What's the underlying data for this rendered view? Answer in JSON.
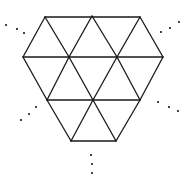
{
  "diagram": {
    "colors": {
      "stroke": "#1a1a1a",
      "dots": "#444444",
      "background": "#ffffff"
    },
    "vertices": {
      "t1": [
        45,
        17
      ],
      "t2": [
        92,
        16
      ],
      "t3": [
        140,
        17
      ],
      "m1": [
        23,
        57
      ],
      "m2": [
        69,
        57
      ],
      "m3": [
        117,
        57
      ],
      "m4": [
        163,
        57
      ],
      "l1": [
        47,
        100
      ],
      "l2": [
        93,
        100
      ],
      "l3": [
        140,
        100
      ],
      "b1": [
        71,
        141
      ],
      "b2": [
        116,
        141
      ]
    },
    "edges": [
      [
        "t1",
        "t3"
      ],
      [
        "m1",
        "m4"
      ],
      [
        "l1",
        "l3"
      ],
      [
        "b1",
        "b2"
      ],
      [
        "t1",
        "m1"
      ],
      [
        "t1",
        "m2"
      ],
      [
        "t2",
        "m2"
      ],
      [
        "t2",
        "m3"
      ],
      [
        "t3",
        "m3"
      ],
      [
        "t3",
        "m4"
      ],
      [
        "m1",
        "l1"
      ],
      [
        "m2",
        "l1"
      ],
      [
        "m2",
        "l2"
      ],
      [
        "m3",
        "l2"
      ],
      [
        "m3",
        "l3"
      ],
      [
        "m4",
        "l3"
      ],
      [
        "l1",
        "b1"
      ],
      [
        "l2",
        "b1"
      ],
      [
        "l2",
        "b2"
      ],
      [
        "l3",
        "b2"
      ]
    ],
    "rays": [
      {
        "name": "ray-top-left",
        "dots": [
          [
            6,
            25
          ],
          [
            17,
            29
          ],
          [
            24,
            33
          ]
        ]
      },
      {
        "name": "ray-top-right",
        "dots": [
          [
            161,
            32
          ],
          [
            170,
            28
          ],
          [
            179,
            22
          ]
        ]
      },
      {
        "name": "ray-bottom-left",
        "dots": [
          [
            21,
            120
          ],
          [
            29,
            114
          ],
          [
            36,
            107
          ]
        ]
      },
      {
        "name": "ray-bottom-right",
        "dots": [
          [
            158,
            102
          ],
          [
            169,
            107
          ],
          [
            178,
            111
          ]
        ]
      },
      {
        "name": "ray-bottom",
        "dots": [
          [
            91,
            155
          ],
          [
            92,
            164
          ],
          [
            92,
            173
          ]
        ]
      }
    ]
  }
}
